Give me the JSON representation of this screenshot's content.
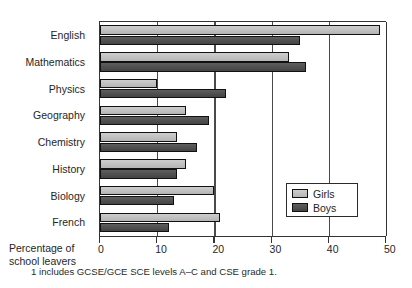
{
  "chart_data": {
    "type": "bar",
    "orientation": "horizontal",
    "title": "",
    "xlabel": "Percentage of school leavers",
    "xlabel_lines": [
      "Percentage of",
      "school leavers"
    ],
    "ylabel": "",
    "categories": [
      "English",
      "Mathematics",
      "Physics",
      "Geography",
      "Chemistry",
      "History",
      "Biology",
      "French"
    ],
    "series": [
      {
        "name": "Girls",
        "color": "#c0c0c0",
        "values": [
          49,
          33,
          10,
          15,
          13.5,
          15,
          20,
          21
        ]
      },
      {
        "name": "Boys",
        "color": "#4f4f4f",
        "values": [
          35,
          36,
          22,
          19,
          17,
          13.5,
          13,
          12
        ]
      }
    ],
    "xlim": [
      0,
      50
    ],
    "xticks": [
      0,
      10,
      20,
      30,
      40,
      50
    ],
    "xticklabels": [
      "0",
      "10",
      "20",
      "30",
      "40",
      "50"
    ],
    "gridlines": [
      10,
      20,
      30,
      40
    ],
    "grid": true,
    "legend_position": "inside-right-lower",
    "legend_entries": [
      "Girls",
      "Boys"
    ],
    "annotations": [
      "1 includes GCSE/GCE SCE levels A–C and CSE grade 1."
    ]
  },
  "footnote": "1 includes GCSE/GCE SCE levels A–C and CSE grade 1."
}
